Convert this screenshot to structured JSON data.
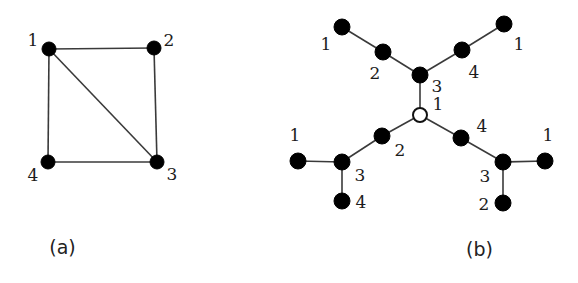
{
  "figure": {
    "background_color": "#ffffff",
    "ink_color": "#000000",
    "edge_color": "#3a3a3a",
    "panels": [
      {
        "id": "a",
        "caption": "(a)",
        "kind": "graph",
        "description": "Undirected graph on 4 vertices drawn as a square with one diagonal",
        "nodes": [
          {
            "id": "n1",
            "label": "1",
            "x": 49,
            "y": 49,
            "style": "filled",
            "radius": 7,
            "label_x": 33,
            "label_y": 46,
            "label_anchor": "middle"
          },
          {
            "id": "n2",
            "label": "2",
            "x": 154,
            "y": 48,
            "style": "filled",
            "radius": 7,
            "label_x": 169,
            "label_y": 46,
            "label_anchor": "middle"
          },
          {
            "id": "n3",
            "label": "3",
            "x": 157,
            "y": 162,
            "style": "filled",
            "radius": 7,
            "label_x": 172,
            "label_y": 180,
            "label_anchor": "middle"
          },
          {
            "id": "n4",
            "label": "4",
            "x": 48,
            "y": 162,
            "style": "filled",
            "radius": 7,
            "label_x": 33,
            "label_y": 181,
            "label_anchor": "middle"
          }
        ],
        "edges": [
          {
            "from": "n1",
            "to": "n2"
          },
          {
            "from": "n2",
            "to": "n3"
          },
          {
            "from": "n3",
            "to": "n4"
          },
          {
            "from": "n4",
            "to": "n1"
          },
          {
            "from": "n1",
            "to": "n3"
          }
        ]
      },
      {
        "id": "b",
        "caption": "(b)",
        "kind": "tree",
        "description": "Tree rooted at a hollow node, branching into three arms with numbered vertices",
        "nodes": [
          {
            "id": "root",
            "label": "1",
            "x": 420,
            "y": 115,
            "style": "hollow",
            "radius": 7,
            "label_x": 438,
            "label_y": 110,
            "label_anchor": "middle"
          },
          {
            "id": "t3",
            "label": "3",
            "x": 420,
            "y": 75,
            "style": "filled",
            "radius": 8,
            "label_x": 437,
            "label_y": 92,
            "label_anchor": "middle"
          },
          {
            "id": "t2",
            "label": "2",
            "x": 383,
            "y": 52,
            "style": "filled",
            "radius": 8,
            "label_x": 375,
            "label_y": 79,
            "label_anchor": "middle"
          },
          {
            "id": "t1",
            "label": "1",
            "x": 342,
            "y": 27,
            "style": "filled",
            "radius": 8,
            "label_x": 326,
            "label_y": 50,
            "label_anchor": "middle"
          },
          {
            "id": "t4",
            "label": "4",
            "x": 462,
            "y": 50,
            "style": "filled",
            "radius": 8,
            "label_x": 474,
            "label_y": 78,
            "label_anchor": "middle"
          },
          {
            "id": "t1r",
            "label": "1",
            "x": 504,
            "y": 24,
            "style": "filled",
            "radius": 8,
            "label_x": 519,
            "label_y": 50,
            "label_anchor": "middle"
          },
          {
            "id": "l2",
            "label": "2",
            "x": 382,
            "y": 136,
            "style": "filled",
            "radius": 8,
            "label_x": 400,
            "label_y": 156,
            "label_anchor": "middle"
          },
          {
            "id": "l3",
            "label": "3",
            "x": 342,
            "y": 162,
            "style": "filled",
            "radius": 8,
            "label_x": 360,
            "label_y": 181,
            "label_anchor": "middle"
          },
          {
            "id": "l4",
            "label": "4",
            "x": 342,
            "y": 201,
            "style": "filled",
            "radius": 8,
            "label_x": 361,
            "label_y": 208,
            "label_anchor": "middle"
          },
          {
            "id": "l1",
            "label": "1",
            "x": 298,
            "y": 161,
            "style": "filled",
            "radius": 8,
            "label_x": 295,
            "label_y": 141,
            "label_anchor": "middle"
          },
          {
            "id": "r4",
            "label": "4",
            "x": 461,
            "y": 138,
            "style": "filled",
            "radius": 8,
            "label_x": 482,
            "label_y": 132,
            "label_anchor": "middle"
          },
          {
            "id": "r3",
            "label": "3",
            "x": 503,
            "y": 162,
            "style": "filled",
            "radius": 8,
            "label_x": 485,
            "label_y": 182,
            "label_anchor": "middle"
          },
          {
            "id": "r2",
            "label": "2",
            "x": 503,
            "y": 203,
            "style": "filled",
            "radius": 8,
            "label_x": 484,
            "label_y": 210,
            "label_anchor": "middle"
          },
          {
            "id": "r1",
            "label": "1",
            "x": 545,
            "y": 161,
            "style": "filled",
            "radius": 8,
            "label_x": 548,
            "label_y": 141,
            "label_anchor": "middle"
          }
        ],
        "edges": [
          {
            "from": "root",
            "to": "t3"
          },
          {
            "from": "t3",
            "to": "t2"
          },
          {
            "from": "t2",
            "to": "t1"
          },
          {
            "from": "t3",
            "to": "t4"
          },
          {
            "from": "t4",
            "to": "t1r"
          },
          {
            "from": "root",
            "to": "l2"
          },
          {
            "from": "l2",
            "to": "l3"
          },
          {
            "from": "l3",
            "to": "l1"
          },
          {
            "from": "l3",
            "to": "l4"
          },
          {
            "from": "root",
            "to": "r4"
          },
          {
            "from": "r4",
            "to": "r3"
          },
          {
            "from": "r3",
            "to": "r1"
          },
          {
            "from": "r3",
            "to": "r2"
          }
        ]
      }
    ]
  }
}
